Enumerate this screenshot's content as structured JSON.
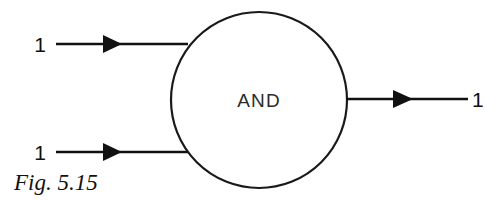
{
  "figure": {
    "caption": "Fig. 5.15",
    "gate": {
      "label": "AND",
      "shape": "circle",
      "center_x": 259,
      "center_y": 100,
      "radius": 88
    },
    "colors": {
      "ink": "#111111",
      "outline": "#1a1a1a",
      "background": "#ffffff",
      "label_ink": "#2b2b2b"
    },
    "inputs": [
      {
        "id": "input-a",
        "value": "1",
        "label_x": 40,
        "label_y": 52,
        "line_y": 44,
        "line_x1": 56,
        "line_x2": 188,
        "arrow_tip_x": 122,
        "arrow_back_x": 103,
        "arrow_half_height": 9
      },
      {
        "id": "input-b",
        "value": "1",
        "label_x": 40,
        "label_y": 160,
        "line_y": 152,
        "line_x1": 56,
        "line_x2": 190,
        "arrow_tip_x": 122,
        "arrow_back_x": 103,
        "arrow_half_height": 9
      }
    ],
    "output": {
      "id": "output-y",
      "value": "1",
      "label_x": 472,
      "label_y": 107,
      "line_y": 99,
      "line_x1": 346,
      "line_x2": 468,
      "arrow_tip_x": 413,
      "arrow_back_x": 393,
      "arrow_half_height": 9
    },
    "caption_x": 14,
    "caption_y": 190
  }
}
